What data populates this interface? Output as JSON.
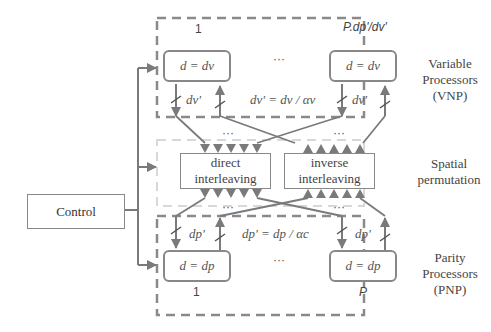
{
  "control": {
    "label": "Control"
  },
  "vnp": {
    "group_label": "Variable\nProcessors\n(VNP)",
    "group_label_lines": [
      "Variable",
      "Processors",
      "(VNP)"
    ],
    "first_index": "1",
    "last_index": "P.d_p'/d_v'",
    "last_index_display": "P.dp'/dv'",
    "processor_eq": "d = dv",
    "link_label": "dv'",
    "ratio_eq": "dv' = dv / αv",
    "ellipsis": "···"
  },
  "spatial": {
    "group_label_lines": [
      "Spatial",
      "permutation"
    ],
    "direct": {
      "line1": "direct",
      "line2": "interleaving"
    },
    "inverse": {
      "line1": "inverse",
      "line2": "interleaving"
    },
    "ellipsis": "···"
  },
  "pnp": {
    "group_label_lines": [
      "Parity",
      "Processors",
      "(PNP)"
    ],
    "first_index": "1",
    "last_index": "P",
    "processor_eq": "d = dp",
    "link_label": "dp'",
    "ratio_eq": "dp' = dp / αc",
    "ellipsis": "···"
  },
  "colors": {
    "line": "#7a7a7a",
    "dashed": "#8a8a8a",
    "light_dashed": "#d8d8d8"
  }
}
